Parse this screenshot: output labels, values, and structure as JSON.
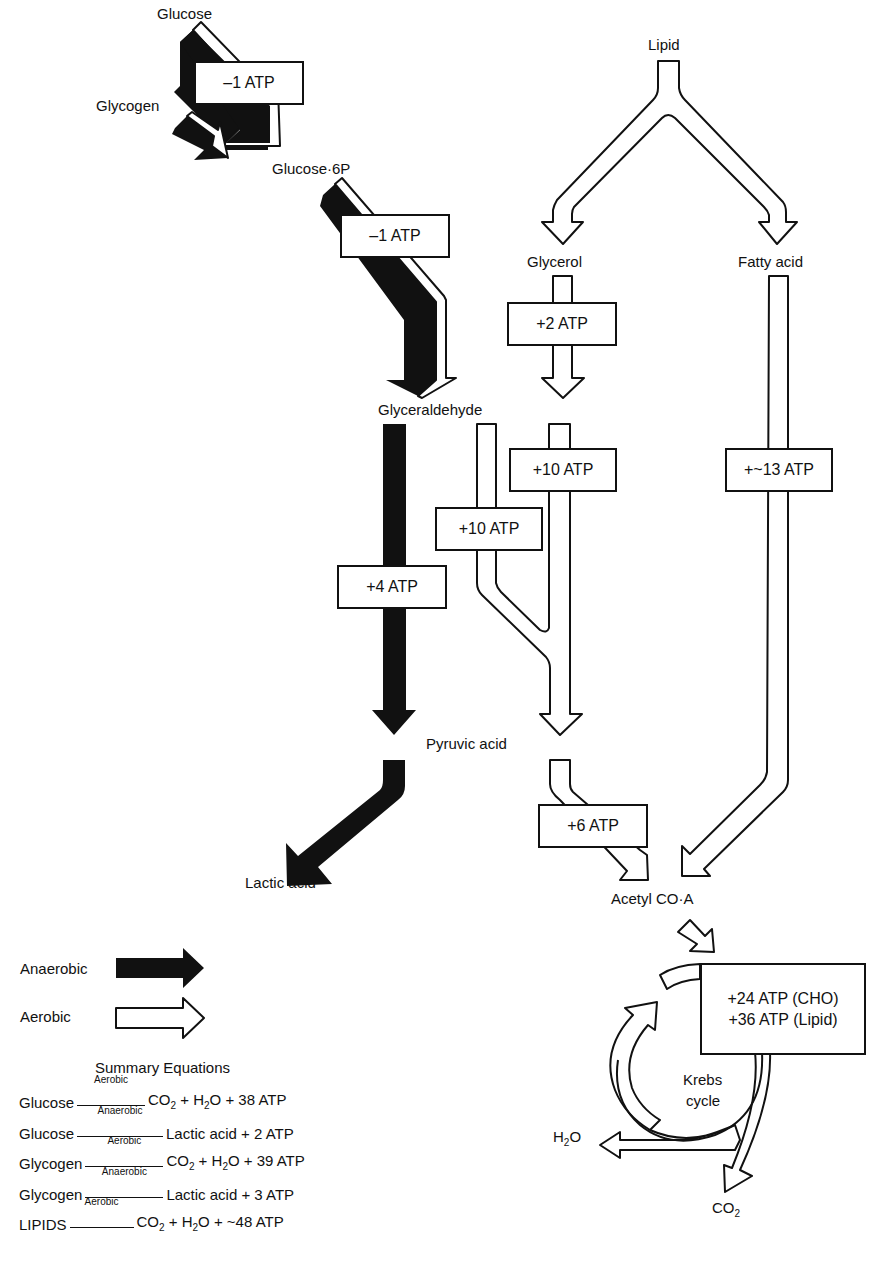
{
  "diagram": {
    "type": "metabolic pathway flow diagram",
    "nodes": {
      "glucose": "Glucose",
      "glycogen": "Glycogen",
      "glucose6p": "Glucose·6P",
      "lipid": "Lipid",
      "glycerol": "Glycerol",
      "fatty_acid": "Fatty acid",
      "glyceraldehyde": "Glyceraldehyde",
      "pyruvic_acid": "Pyruvic acid",
      "lactic_acid": "Lactic acid",
      "acetyl_coa": "Acetyl CO·A",
      "krebs_line1": "Krebs",
      "krebs_line2": "cycle",
      "h2o": "H",
      "h2o_sub": "2",
      "h2o_tail": "O",
      "co2": "CO",
      "co2_sub": "2"
    },
    "atp_boxes": {
      "glucose_to_g6p": "–1 ATP",
      "g6p_to_glyceraldehyde": "–1 ATP",
      "glycerol": "+2 ATP",
      "glyceraldehyde_anaerobic": "+4 ATP",
      "glyceraldehyde_aerobic_left": "+10 ATP",
      "glyceraldehyde_aerobic_right": "+10 ATP",
      "fatty_acid": "+~13 ATP",
      "pyruvic_to_acetyl": "+6 ATP",
      "krebs_cho": "+24 ATP (CHO)",
      "krebs_lipid": "+36 ATP (Lipid)"
    },
    "edges": [
      {
        "from": "Glucose",
        "to": "Glucose·6P",
        "mode": "anaerobic+aerobic",
        "atp": "–1 ATP"
      },
      {
        "from": "Glycogen",
        "to": "Glucose·6P",
        "mode": "anaerobic+aerobic"
      },
      {
        "from": "Glucose·6P",
        "to": "Glyceraldehyde",
        "mode": "anaerobic+aerobic",
        "atp": "–1 ATP"
      },
      {
        "from": "Lipid",
        "to": "Glycerol",
        "mode": "aerobic"
      },
      {
        "from": "Lipid",
        "to": "Fatty acid",
        "mode": "aerobic"
      },
      {
        "from": "Glycerol",
        "to": "Glyceraldehyde",
        "mode": "aerobic",
        "atp": "+2 ATP"
      },
      {
        "from": "Glyceraldehyde",
        "to": "Pyruvic acid",
        "mode": "anaerobic",
        "atp": "+4 ATP"
      },
      {
        "from": "Glyceraldehyde",
        "to": "Pyruvic acid",
        "mode": "aerobic",
        "atp": "+10 ATP"
      },
      {
        "from": "Glyceraldehyde",
        "to": "Pyruvic acid",
        "mode": "aerobic",
        "atp": "+10 ATP"
      },
      {
        "from": "Pyruvic acid",
        "to": "Lactic acid",
        "mode": "anaerobic"
      },
      {
        "from": "Pyruvic acid",
        "to": "Acetyl CO·A",
        "mode": "aerobic",
        "atp": "+6 ATP"
      },
      {
        "from": "Fatty acid",
        "to": "Acetyl CO·A",
        "mode": "aerobic",
        "atp": "+~13 ATP"
      },
      {
        "from": "Acetyl CO·A",
        "to": "Krebs cycle",
        "mode": "aerobic",
        "atp": "+24 ATP (CHO) / +36 ATP (Lipid)"
      },
      {
        "from": "Krebs cycle",
        "to": "H2O",
        "mode": "aerobic"
      },
      {
        "from": "Krebs cycle",
        "to": "CO2",
        "mode": "aerobic"
      }
    ]
  },
  "legend": {
    "anaerobic": {
      "label": "Anaerobic",
      "color": "#111111"
    },
    "aerobic": {
      "label": "Aerobic",
      "color": "#ffffff"
    }
  },
  "summary": {
    "title": "Summary Equations",
    "equations": [
      {
        "substrate": "Glucose",
        "condition": "Aerobic",
        "product_a": "CO",
        "product_a_sub": "2",
        "product_b": " + H",
        "product_b_sub": "2",
        "product_c": "O + 38 ATP"
      },
      {
        "substrate": "Glucose",
        "condition": "Anaerobic",
        "product_a": "Lactic acid + 2 ATP"
      },
      {
        "substrate": "Glycogen",
        "condition": "Aerobic",
        "product_a": "CO",
        "product_a_sub": "2",
        "product_b": " + H",
        "product_b_sub": "2",
        "product_c": "O + 39 ATP"
      },
      {
        "substrate": "Glycogen",
        "condition": "Anaerobic",
        "product_a": "Lactic acid + 3 ATP"
      },
      {
        "substrate": "LIPIDS",
        "condition": "Aerobic",
        "product_a": "CO",
        "product_a_sub": "2",
        "product_b": " + H",
        "product_b_sub": "2",
        "product_c": "O + ~48 ATP"
      }
    ]
  }
}
